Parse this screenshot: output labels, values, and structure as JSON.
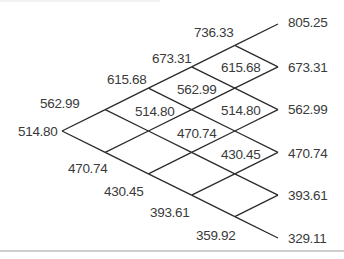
{
  "diagram": {
    "type": "binomial-tree",
    "steps": 5,
    "line_color": "#2b2b2b",
    "text_color": "#3a3a3a",
    "levels": [
      [
        "514.80"
      ],
      [
        "562.99",
        "470.74"
      ],
      [
        "615.68",
        "514.80",
        "430.45"
      ],
      [
        "673.31",
        "562.99",
        "470.74",
        "393.61"
      ],
      [
        "736.33",
        "615.68",
        "514.80",
        "430.45",
        "359.92"
      ],
      [
        "805.25",
        "673.31",
        "562.99",
        "470.74",
        "393.61",
        "329.11"
      ]
    ]
  }
}
